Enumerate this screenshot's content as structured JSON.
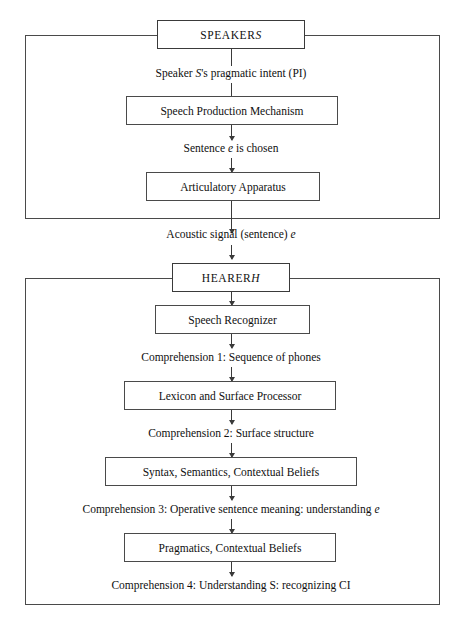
{
  "diagram": {
    "title_speaker": "SPEAKER S",
    "title_hearer": "HEARER H",
    "speaker_section": {
      "header": "SPEAKER ",
      "header_italic": "S",
      "label_pragmatic_intent": "Speaker ",
      "label_pragmatic_intent_italic": "S",
      "label_pragmatic_intent_tail": "'s pragmatic intent (PI)",
      "box_speech_production": "Speech Production Mechanism",
      "label_sentence_chosen_pre": "Sentence ",
      "label_sentence_chosen_italic": "e",
      "label_sentence_chosen_post": " is chosen",
      "box_articulatory": "Articulatory Apparatus"
    },
    "channel": {
      "label_acoustic_pre": "Acoustic signal (sentence) ",
      "label_acoustic_italic": "e"
    },
    "hearer_section": {
      "header": "HEARER ",
      "header_italic": "H",
      "box_speech_recognizer": "Speech Recognizer",
      "label_comprehension_1": "Comprehension 1: Sequence of phones",
      "box_lexicon": "Lexicon and Surface Processor",
      "label_comprehension_2": "Comprehension 2: Surface structure",
      "box_syntax": "Syntax, Semantics, Contextual Beliefs",
      "label_comprehension_3_pre": "Comprehension 3: Operative sentence meaning: understanding ",
      "label_comprehension_3_italic": "e",
      "box_pragmatics": "Pragmatics, Contextual Beliefs",
      "label_comprehension_4": "Comprehension 4: Understanding S: recognizing CI"
    },
    "colors": {
      "stroke": "#4a4a4a",
      "text": "#101010",
      "background": "#ffffff"
    }
  }
}
